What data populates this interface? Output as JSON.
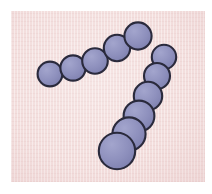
{
  "figure": {
    "canvas_width": 212,
    "canvas_height": 194,
    "frame_color": "#ffffff"
  },
  "field": {
    "name": "stained-background-field",
    "x": 11,
    "y": 11,
    "width": 194,
    "height": 171,
    "background_color": "#f3dedd",
    "striation_color": "#e2bebe",
    "highlight_color": "#ffffff"
  },
  "style": {
    "cell_fill": "#8e90bd",
    "cell_fill_light": "#9fa1c9",
    "cell_fill_dark": "#7f81b0",
    "cell_outline": "#2a2a3c",
    "cell_outline_width": 2.1
  },
  "chart_data": {
    "type": "scatter",
    "xlabel": "",
    "ylabel": "",
    "xlim": [
      11,
      205
    ],
    "ylim": [
      11,
      182
    ],
    "grid": false,
    "legend": null,
    "units": "pixels",
    "series": [
      {
        "name": "upper-chain",
        "marker": "circle",
        "count": 5,
        "fill": "#8e90bd",
        "edgecolor": "#2a2a3c",
        "points": [
          {
            "index": 1,
            "x": 50,
            "y": 74,
            "r": 12.4
          },
          {
            "index": 2,
            "x": 73,
            "y": 68,
            "r": 12.6
          },
          {
            "index": 3,
            "x": 95,
            "y": 61,
            "r": 12.8
          },
          {
            "index": 4,
            "x": 117,
            "y": 48,
            "r": 13.2
          },
          {
            "index": 5,
            "x": 138,
            "y": 36,
            "r": 13.6
          }
        ]
      },
      {
        "name": "lower-chain",
        "marker": "circle",
        "count": 6,
        "fill": "#8e90bd",
        "edgecolor": "#2a2a3c",
        "points": [
          {
            "index": 1,
            "x": 164,
            "y": 57,
            "r": 12.2
          },
          {
            "index": 2,
            "x": 157,
            "y": 76,
            "r": 13.0
          },
          {
            "index": 3,
            "x": 148,
            "y": 96,
            "r": 14.2
          },
          {
            "index": 4,
            "x": 139,
            "y": 116,
            "r": 15.4
          },
          {
            "index": 5,
            "x": 129,
            "y": 134,
            "r": 16.6
          },
          {
            "index": 6,
            "x": 117,
            "y": 151,
            "r": 18.2
          }
        ]
      }
    ]
  }
}
